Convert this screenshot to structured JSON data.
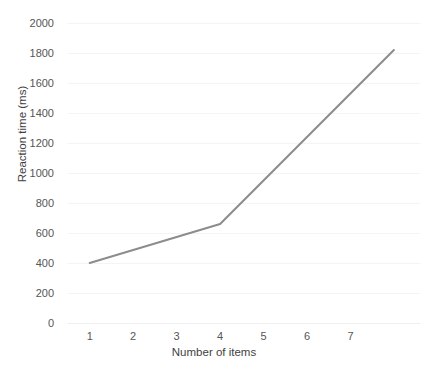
{
  "chart_data": {
    "type": "line",
    "title": "",
    "xlabel": "Number of items",
    "ylabel": "Reaction time (ms)",
    "x": [
      1,
      4,
      8
    ],
    "values": [
      400,
      660,
      1820
    ],
    "series": [
      {
        "name": "Reaction time",
        "color": "#8c8c8c",
        "points": [
          {
            "x": 1,
            "y": 400
          },
          {
            "x": 4,
            "y": 660
          },
          {
            "x": 8,
            "y": 1820
          }
        ]
      }
    ],
    "xlim": [
      0.5,
      8.6
    ],
    "ylim": [
      0,
      2000
    ],
    "ytick_labels": [
      "2000",
      "1800",
      "1600",
      "1400",
      "1200",
      "1000",
      "800",
      "600",
      "400",
      "200",
      "0"
    ],
    "ytick_values": [
      2000,
      1800,
      1600,
      1400,
      1200,
      1000,
      800,
      600,
      400,
      200,
      0
    ],
    "xtick_labels": [
      "1",
      "2",
      "3",
      "4",
      "5",
      "6",
      "7"
    ],
    "xtick_values": [
      1,
      2,
      3,
      4,
      5,
      6,
      7
    ],
    "grid": true,
    "grid_axis": "y",
    "legend": "none",
    "line_color": "#8c8c8c",
    "line_width": 2,
    "markers": false
  },
  "header": {
    "clipped_text": "",
    "clipped_text_right": ""
  }
}
